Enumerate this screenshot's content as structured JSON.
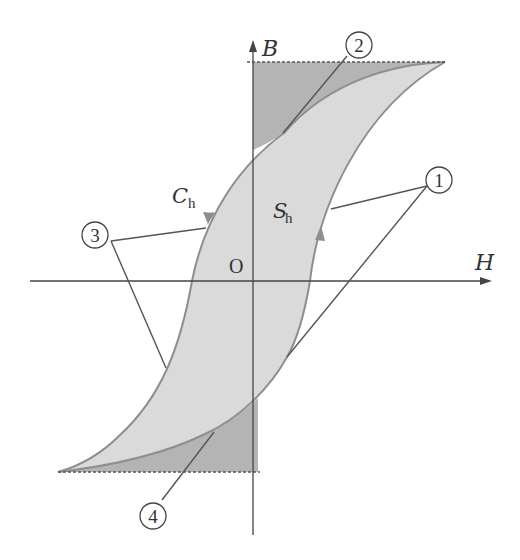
{
  "diagram": {
    "type": "magnetic hysteresis loop (B-H curve)",
    "axes": {
      "x_label": "H",
      "y_label": "B",
      "origin_label": "O"
    },
    "region_labels": {
      "left_area": "C",
      "left_area_sub": "h",
      "inner_area": "S",
      "inner_area_sub": "h"
    },
    "callouts": [
      {
        "id": "1",
        "label": "1",
        "text": "①"
      },
      {
        "id": "2",
        "label": "2",
        "text": "②"
      },
      {
        "id": "3",
        "label": "3",
        "text": "③"
      },
      {
        "id": "4",
        "label": "4",
        "text": "④"
      }
    ],
    "colors": {
      "loop_fill": "#dadada",
      "dark_fill": "#b4b4b4",
      "curve_stroke": "#8e8e8e",
      "axis_stroke": "#444444",
      "leader_stroke": "#555555"
    }
  }
}
